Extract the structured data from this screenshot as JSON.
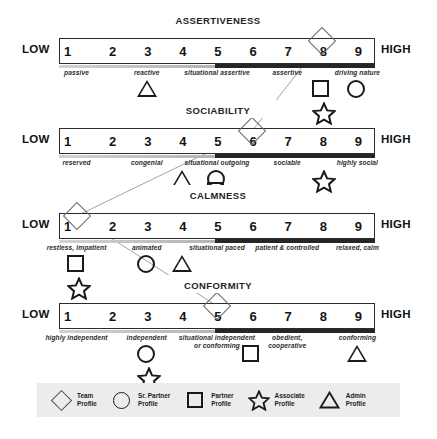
{
  "scale": {
    "low_label": "LOW",
    "high_label": "HIGH",
    "ticks": [
      "1",
      "2",
      "3",
      "4",
      "5",
      "6",
      "7",
      "8",
      "9"
    ]
  },
  "traits": [
    {
      "title": "ASSERTIVENESS",
      "descriptors": [
        {
          "text": "passive",
          "pos": 1
        },
        {
          "text": "reactive",
          "pos": 3
        },
        {
          "text": "situational assertive",
          "pos": 5
        },
        {
          "text": "assertive",
          "pos": 7
        },
        {
          "text": "driving nature",
          "pos": 9
        }
      ],
      "team_profile_pos": 8,
      "markers": [
        {
          "shape": "triangle",
          "pos": 3,
          "tier": 1
        },
        {
          "shape": "square",
          "pos": 8,
          "tier": 1
        },
        {
          "shape": "circle",
          "pos": 9,
          "tier": 1
        },
        {
          "shape": "star",
          "pos": 8,
          "tier": 2
        }
      ]
    },
    {
      "title": "SOCIABILITY",
      "descriptors": [
        {
          "text": "reserved",
          "pos": 1
        },
        {
          "text": "congenial",
          "pos": 3
        },
        {
          "text": "situational outgoing",
          "pos": 5
        },
        {
          "text": "sociable",
          "pos": 7
        },
        {
          "text": "highly social",
          "pos": 9
        }
      ],
      "team_profile_pos": 6,
      "markers": [
        {
          "shape": "triangle",
          "pos": 4,
          "tier": 1
        },
        {
          "shape": "circle",
          "pos": 5,
          "tier": 1
        },
        {
          "shape": "square",
          "pos": 5,
          "tier": 1.55
        },
        {
          "shape": "star",
          "pos": 8,
          "tier": 1
        }
      ]
    },
    {
      "title": "CALMNESS",
      "descriptors": [
        {
          "text": "restless, impatient",
          "pos": 1
        },
        {
          "text": "animated",
          "pos": 3
        },
        {
          "text": "situational paced",
          "pos": 5
        },
        {
          "text": "patient & controlled",
          "pos": 7
        },
        {
          "text": "relaxed, calm",
          "pos": 9
        }
      ],
      "team_profile_pos": 1,
      "markers": [
        {
          "shape": "square",
          "pos": 1,
          "tier": 1
        },
        {
          "shape": "circle",
          "pos": 3,
          "tier": 1
        },
        {
          "shape": "triangle",
          "pos": 4,
          "tier": 1
        },
        {
          "shape": "star",
          "pos": 1,
          "tier": 2
        }
      ]
    },
    {
      "title": "CONFORMITY",
      "descriptors": [
        {
          "text": "highly independent",
          "pos": 1
        },
        {
          "text": "independent",
          "pos": 3
        },
        {
          "text": "situational independent\nor conforming",
          "pos": 5
        },
        {
          "text": "obedient,\ncooperative",
          "pos": 7
        },
        {
          "text": "conforming",
          "pos": 9
        }
      ],
      "team_profile_pos": 5,
      "markers": [
        {
          "shape": "circle",
          "pos": 3,
          "tier": 1
        },
        {
          "shape": "square",
          "pos": 6,
          "tier": 1
        },
        {
          "shape": "triangle",
          "pos": 9,
          "tier": 1
        },
        {
          "shape": "star",
          "pos": 3,
          "tier": 2
        }
      ]
    }
  ],
  "legend": [
    {
      "shape": "diamond",
      "label": "Team\nProfile"
    },
    {
      "shape": "circle",
      "label": "Sr. Partner\nProfile"
    },
    {
      "shape": "square",
      "label": "Partner\nProfile"
    },
    {
      "shape": "star",
      "label": "Associate\nProfile"
    },
    {
      "shape": "triangle",
      "label": "Admin\nProfile"
    }
  ],
  "colors": {
    "bar_low": "#c8c8c8",
    "bar_high": "#262626",
    "legend_bg": "#ececec",
    "stroke": "#1a1a1a",
    "diamond_stroke": "#6b6b6b"
  }
}
